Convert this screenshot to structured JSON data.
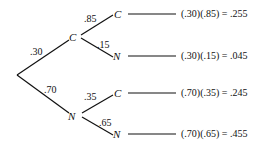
{
  "diagram": {
    "type": "probability-tree",
    "first_level": [
      {
        "node": "C",
        "probability": ".30"
      },
      {
        "node": "N",
        "probability": ".70"
      }
    ],
    "second_level": [
      {
        "parent": "C",
        "node": "C",
        "probability": ".85",
        "result": "(.30)(.85) = .255"
      },
      {
        "parent": "C",
        "node": "N",
        "probability": ".15",
        "result": "(.30)(.15) = .045"
      },
      {
        "parent": "N",
        "node": "C",
        "probability": ".35",
        "result": "(.70)(.35) = .245"
      },
      {
        "parent": "N",
        "node": "N",
        "probability": ".65",
        "result": "(.70)(.65) = .455"
      }
    ]
  }
}
